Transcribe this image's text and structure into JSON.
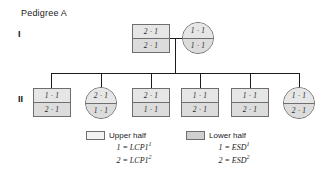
{
  "title": "Pedigree A",
  "generations": [
    {
      "label": "I"
    },
    {
      "label": "II"
    }
  ],
  "individuals": {
    "founder_father": {
      "sex": "male",
      "upper": "2 · 1",
      "lower": "2 · 1"
    },
    "founder_mother": {
      "sex": "female",
      "upper": "1 · 1",
      "lower": "1 · 1"
    },
    "child_1": {
      "sex": "male",
      "upper": "1 · 1",
      "lower": "2 · 1"
    },
    "child_2": {
      "sex": "female",
      "upper": "2 · 1",
      "lower": "1 · 1"
    },
    "child_3": {
      "sex": "male",
      "upper": "2 · 1",
      "lower": "1 · 1"
    },
    "child_4": {
      "sex": "male",
      "upper": "1 · 1",
      "lower": "2 · 1"
    },
    "child_5": {
      "sex": "male",
      "upper": "1 · 1",
      "lower": "2 · 1"
    },
    "child_6": {
      "sex": "female",
      "upper": "1 · 1",
      "lower": "2 · 1"
    }
  },
  "legend": {
    "upper": {
      "heading": "Upper half",
      "allele_1_num": "1 = ",
      "allele_1_gene": "LCP1",
      "allele_1_sup": "1",
      "allele_2_num": "2 = ",
      "allele_2_gene": "LCP1",
      "allele_2_sup": "2"
    },
    "lower": {
      "heading": "Lower half",
      "allele_1_num": "1 = ",
      "allele_1_gene": "ESD",
      "allele_1_sup": "1",
      "allele_2_num": "2 = ",
      "allele_2_gene": "ESD",
      "allele_2_sup": "2"
    }
  },
  "colors": {
    "line": "#1b1b1b",
    "symbol_border": "#6e6e6e",
    "upper_fill": "#e6e6e6",
    "lower_fill": "#dcdcdc",
    "background": "#ffffff"
  }
}
